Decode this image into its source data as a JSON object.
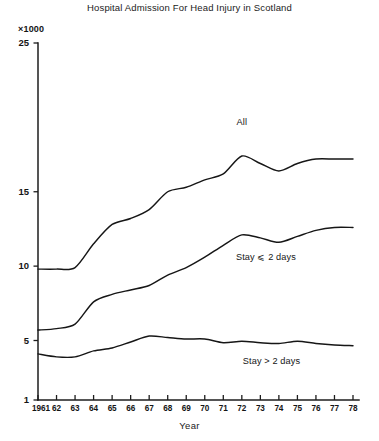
{
  "chart_data": {
    "type": "line",
    "title": "Hospital Admission For Head Injury in Scotland",
    "xlabel": "Year",
    "ylabel": "",
    "y_unit_label": "×1000",
    "grid": false,
    "legend_position": "inline-annotations",
    "xlim": [
      1961,
      1978
    ],
    "ylim": [
      1,
      25
    ],
    "yticks": [
      25,
      15,
      10,
      5,
      1
    ],
    "ytick_labels": [
      "25",
      "15",
      "10",
      "5",
      "1"
    ],
    "x": [
      1961,
      1962,
      1963,
      1964,
      1965,
      1966,
      1967,
      1968,
      1969,
      1970,
      1971,
      1972,
      1973,
      1974,
      1975,
      1976,
      1977,
      1978
    ],
    "xtick_labels": [
      "1961",
      "62",
      "63",
      "64",
      "65",
      "66",
      "67",
      "68",
      "69",
      "70",
      "71",
      "72",
      "73",
      "74",
      "75",
      "76",
      "77",
      "78"
    ],
    "series": [
      {
        "name": "All",
        "label": "All",
        "values": [
          9.8,
          9.8,
          9.9,
          11.5,
          12.8,
          13.2,
          13.8,
          15.0,
          15.3,
          15.8,
          16.2,
          17.4,
          16.9,
          16.4,
          16.9,
          17.2,
          17.2,
          17.2
        ]
      },
      {
        "name": "Stay ⩽ 2 days",
        "label": "Stay ⩽ 2 days",
        "values": [
          5.7,
          5.8,
          6.1,
          7.6,
          8.1,
          8.4,
          8.7,
          9.4,
          9.9,
          10.6,
          11.4,
          12.1,
          11.9,
          11.6,
          12.0,
          12.4,
          12.6,
          12.6
        ]
      },
      {
        "name": "Stay > 2 days",
        "label": "Stay > 2 days",
        "values": [
          4.1,
          3.9,
          3.9,
          4.3,
          4.5,
          4.9,
          5.3,
          5.2,
          5.1,
          5.1,
          4.85,
          4.95,
          4.85,
          4.8,
          4.95,
          4.8,
          4.7,
          4.65
        ]
      }
    ],
    "annotations": [
      {
        "text": "All",
        "x": 1972,
        "y": 19.6
      },
      {
        "text": "Stay ⩽ 2 days",
        "x": 1973.3,
        "y": 10.6
      },
      {
        "text": "Stay > 2 days",
        "x": 1973.6,
        "y": 3.55
      }
    ]
  }
}
